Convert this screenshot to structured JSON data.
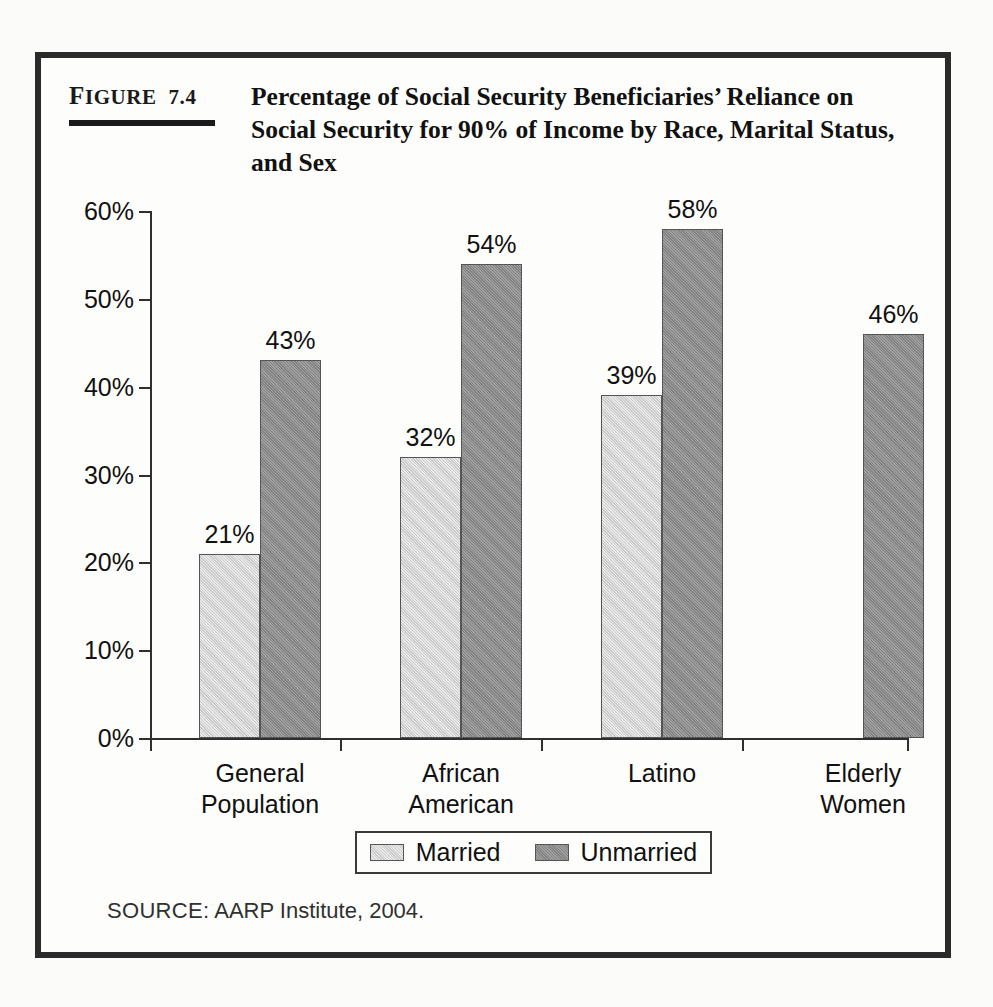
{
  "figure": {
    "number_prefix": "F",
    "number_rest": "IGURE",
    "number_value": "7.4",
    "title": "Percentage of Social Security Beneficiaries’ Reliance on Social Security for 90% of Income by Race, Marital Status, and Sex",
    "source_label": "SOURCE:",
    "source_text": "AARP Institute, 2004.",
    "border_color": "#2b2b2b"
  },
  "chart_data": {
    "type": "bar",
    "title": "Percentage of Social Security Beneficiaries’ Reliance on Social Security for 90% of Income by Race, Marital Status, and Sex",
    "xlabel": "",
    "ylabel": "",
    "ylim": [
      0,
      60
    ],
    "ytick_values": [
      0,
      10,
      20,
      30,
      40,
      50,
      60
    ],
    "ytick_labels": [
      "0%",
      "10%",
      "20%",
      "30%",
      "40%",
      "50%",
      "60%"
    ],
    "grid": false,
    "legend_position": "bottom",
    "categories": [
      "General Population",
      "African American",
      "Latino",
      "Elderly Women"
    ],
    "category_lines": [
      [
        "General",
        "Population"
      ],
      [
        "African",
        "American"
      ],
      [
        "Latino",
        ""
      ],
      [
        "Elderly",
        "Women"
      ]
    ],
    "series": [
      {
        "name": "Married",
        "color": "#d2d2d2",
        "values": [
          21,
          32,
          39,
          null
        ],
        "labels": [
          "21%",
          "32%",
          "39%",
          ""
        ]
      },
      {
        "name": "Unmarried",
        "color": "#8d8d8d",
        "values": [
          43,
          54,
          58,
          46
        ],
        "labels": [
          "43%",
          "54%",
          "58%",
          "46%"
        ]
      }
    ]
  },
  "legend": {
    "items": [
      {
        "label": "Married"
      },
      {
        "label": "Unmarried"
      }
    ]
  }
}
